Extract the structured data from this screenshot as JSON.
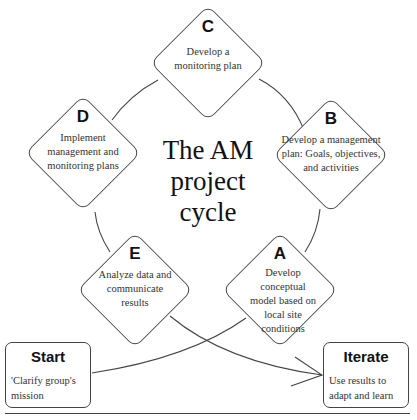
{
  "diagram": {
    "title": "The AM project cycle",
    "title_lines": [
      "The AM",
      "project",
      "cycle"
    ],
    "steps": [
      {
        "letter": "A",
        "text": "Develop conceptual model based on local site conditions"
      },
      {
        "letter": "B",
        "text": "Develop a management plan: Goals, objectives, and activities"
      },
      {
        "letter": "C",
        "text": "Develop a monitoring plan"
      },
      {
        "letter": "D",
        "text": "Implement management and monitoring plans"
      },
      {
        "letter": "E",
        "text": "Analyze data and communicate results"
      }
    ],
    "start": {
      "title": "Start",
      "text": "'Clarify group's mission"
    },
    "iterate": {
      "title": "Iterate",
      "text": "Use results to adapt and learn"
    },
    "colors": {
      "stroke": "#444444",
      "text": "#333333",
      "background": "#ffffff"
    }
  }
}
